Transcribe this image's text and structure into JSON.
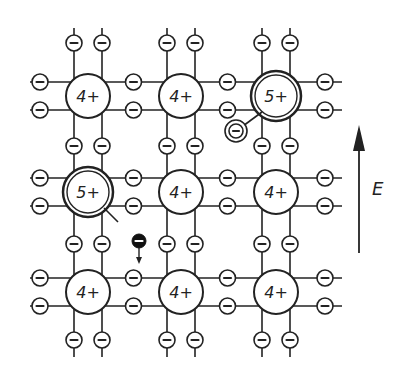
{
  "diagram": {
    "title": "",
    "lattice": {
      "columns_x": [
        88,
        181,
        276
      ],
      "rows_y": [
        96,
        192,
        292
      ],
      "ions": [
        {
          "row": 0,
          "col": 0,
          "label": "4+",
          "type": "host"
        },
        {
          "row": 0,
          "col": 1,
          "label": "4+",
          "type": "host"
        },
        {
          "row": 0,
          "col": 2,
          "label": "5+",
          "type": "donor"
        },
        {
          "row": 1,
          "col": 0,
          "label": "5+",
          "type": "donor"
        },
        {
          "row": 1,
          "col": 1,
          "label": "4+",
          "type": "host"
        },
        {
          "row": 1,
          "col": 2,
          "label": "4+",
          "type": "host"
        },
        {
          "row": 2,
          "col": 0,
          "label": "4+",
          "type": "host"
        },
        {
          "row": 2,
          "col": 1,
          "label": "4+",
          "type": "host"
        },
        {
          "row": 2,
          "col": 2,
          "label": "4+",
          "type": "host"
        }
      ],
      "bond_electron_symbol": "−"
    },
    "bound_electron": {
      "label": "−",
      "x": 236,
      "y": 131,
      "description": "extra electron bound to 5+ donor"
    },
    "free_electron": {
      "label": "−",
      "x": 139,
      "y": 241,
      "description": "free electron moving downward"
    },
    "field_arrow": {
      "label": "E",
      "direction": "up"
    }
  }
}
